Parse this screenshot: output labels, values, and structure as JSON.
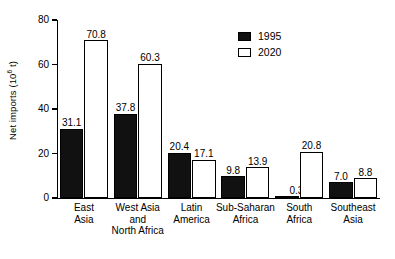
{
  "chart_data": {
    "type": "bar",
    "title": "",
    "xlabel": "",
    "ylabel": "Net imports (10⁶ t)",
    "ylabel_base": "Net imports (10",
    "ylabel_exp": "6",
    "ylabel_tail": " t)",
    "ylim": [
      0,
      80
    ],
    "ytick_values": [
      0,
      20,
      40,
      60,
      80
    ],
    "ytick_labels": [
      "0",
      "20",
      "40",
      "60",
      "80"
    ],
    "grid": false,
    "legend_position": "top-right",
    "categories": [
      "East Asia",
      "West Asia and North Africa",
      "Latin America",
      "Sub-Saharan Africa",
      "South Africa",
      "Southeast Asia"
    ],
    "category_lines": [
      [
        "East",
        "Asia"
      ],
      [
        "West Asia",
        "and",
        "North Africa"
      ],
      [
        "Latin",
        "America"
      ],
      [
        "Sub-Saharan",
        "Africa"
      ],
      [
        "South",
        "Africa"
      ],
      [
        "Southeast",
        "Asia"
      ]
    ],
    "series": [
      {
        "name": "1995",
        "color": "#111111",
        "values": [
          31.1,
          37.8,
          20.4,
          9.8,
          0.3,
          7.0
        ],
        "labels": [
          "31.1",
          "37.8",
          "20.4",
          "9.8",
          "0.3",
          "7.0"
        ]
      },
      {
        "name": "2020",
        "color": "#ffffff",
        "values": [
          70.8,
          60.3,
          17.1,
          13.9,
          20.8,
          8.8
        ],
        "labels": [
          "70.8",
          "60.3",
          "17.1",
          "13.9",
          "20.8",
          "8.8"
        ]
      }
    ]
  },
  "legend": {
    "items": [
      {
        "label": "1995",
        "style": "filled"
      },
      {
        "label": "2020",
        "style": "outline"
      }
    ]
  },
  "colors": {
    "series_1995": "#111111",
    "series_2020": "#ffffff",
    "axis": "#000000",
    "background": "#ffffff"
  }
}
